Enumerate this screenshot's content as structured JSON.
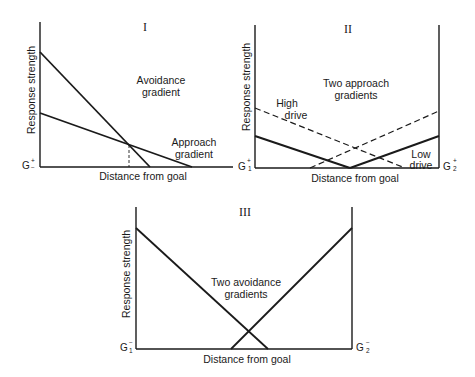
{
  "panels": [
    {
      "id": "I",
      "title": "I",
      "y_axis_label": "Response strength",
      "x_axis_label": "Distance from goal",
      "goal_left": {
        "letter": "G",
        "sign_top": "+",
        "sign_bottom": "−"
      },
      "annotations": [
        {
          "text": [
            "Avoidance",
            "gradient"
          ]
        },
        {
          "text": [
            "Approach",
            "gradient"
          ]
        }
      ],
      "lines": [
        {
          "name": "Avoidance gradient",
          "style": "solid",
          "from": [
            0,
            0.8
          ],
          "to": [
            0.57,
            0
          ]
        },
        {
          "name": "Approach gradient",
          "style": "solid",
          "from": [
            0,
            0.37
          ],
          "to": [
            0.79,
            0
          ]
        },
        {
          "name": "Intersection marker",
          "style": "dashed",
          "from": [
            0.46,
            0.16
          ],
          "to": [
            0.46,
            0
          ]
        }
      ]
    },
    {
      "id": "II",
      "title": "II",
      "y_axis_label": "Response strength",
      "x_axis_label": "Distance from goal",
      "goal_left": {
        "letter": "G",
        "sign_top": "+",
        "sub": "1"
      },
      "goal_right": {
        "letter": "G",
        "sign_top": "+",
        "sub": "2"
      },
      "annotations": [
        {
          "text": [
            "Two approach",
            "gradients"
          ]
        },
        {
          "text": [
            "High",
            "drive"
          ]
        },
        {
          "text": [
            "Low",
            "drive"
          ]
        }
      ],
      "lines": [
        {
          "name": "High drive from G1",
          "style": "dashed",
          "from": [
            0,
            0.42
          ],
          "to": [
            0.82,
            0
          ]
        },
        {
          "name": "High drive from G2",
          "style": "dashed",
          "from": [
            0.3,
            0
          ],
          "to": [
            1,
            0.4
          ]
        },
        {
          "name": "Low drive from G1",
          "style": "solid",
          "from": [
            0,
            0.22
          ],
          "to": [
            0.52,
            0
          ]
        },
        {
          "name": "Low drive from G2",
          "style": "solid",
          "from": [
            0.52,
            0
          ],
          "to": [
            1,
            0.22
          ]
        }
      ]
    },
    {
      "id": "III",
      "title": "III",
      "y_axis_label": "Response strength",
      "x_axis_label": "Distance from goal",
      "goal_left": {
        "letter": "G",
        "sign_top": "−",
        "sub": "1"
      },
      "goal_right": {
        "letter": "G",
        "sign_top": "−",
        "sub": "2"
      },
      "annotations": [
        {
          "text": [
            "Two avoidance",
            "gradients"
          ]
        }
      ],
      "lines": [
        {
          "name": "Avoidance from G1",
          "style": "solid",
          "from": [
            0,
            0.85
          ],
          "to": [
            0.61,
            0
          ]
        },
        {
          "name": "Avoidance from G2",
          "style": "solid",
          "from": [
            0.44,
            0
          ],
          "to": [
            1,
            0.85
          ]
        }
      ]
    }
  ],
  "colors": {
    "ink": "#1a1a1a",
    "background": "#ffffff"
  }
}
